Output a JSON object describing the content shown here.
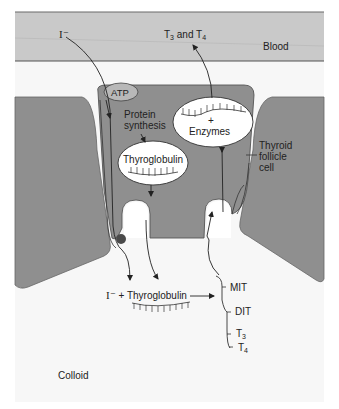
{
  "diagram": {
    "title": "",
    "colors": {
      "page_bg": "#ffffff",
      "colloid_bg": "#f7f7f7",
      "blood_band": "#c9c9c9",
      "cell_fill": "#8f8f8f",
      "cell_outline": "#555555",
      "vesicle_fill": "#ffffff",
      "line": "#222222",
      "atp_fill": "#b8b8b8",
      "transporter_dot": "#4a4a4a"
    },
    "regions": {
      "blood": "Blood",
      "cell": "Thyroid follicle cell",
      "cell_line1": "Thyroid",
      "cell_line2": "follicle",
      "cell_line3": "cell",
      "colloid": "Colloid"
    },
    "labels": {
      "iodide_in": "I⁻",
      "hormones_out_T3": "T",
      "hormones_out_3": "3",
      "hormones_out_and": " and T",
      "hormones_out_4": "4",
      "atp": "ATP",
      "protein_synthesis_1": "Protein",
      "protein_synthesis_2": "synthesis",
      "thyroglobulin": "Thyroglobulin",
      "enzymes_plus": "+",
      "enzymes": "Enzymes",
      "colloid_iodide": "I⁻",
      "colloid_plus_tg": " + Thyroglobulin",
      "mit": "MIT",
      "dit": "DIT",
      "t3_T": "T",
      "t3_sub": "3",
      "t4_T": "T",
      "t4_sub": "4"
    },
    "nodes": [
      {
        "id": "blood",
        "label": "Blood"
      },
      {
        "id": "iodide",
        "label": "I⁻"
      },
      {
        "id": "atp",
        "label": "ATP"
      },
      {
        "id": "protein-synthesis",
        "label": "Protein synthesis"
      },
      {
        "id": "thyroglobulin-vesicle",
        "label": "Thyroglobulin"
      },
      {
        "id": "enzyme-vesicle",
        "label": "+ Enzymes"
      },
      {
        "id": "colloid-thyroglobulin",
        "label": "I⁻ + Thyroglobulin"
      },
      {
        "id": "iodinated-products",
        "label": "MIT, DIT, T3, T4"
      },
      {
        "id": "hormones",
        "label": "T3 and T4"
      },
      {
        "id": "colloid",
        "label": "Colloid"
      }
    ],
    "edges": [
      {
        "from": "iodide",
        "to": "colloid-thyroglobulin",
        "note": "I⁻ transported through cell (ATP) into colloid"
      },
      {
        "from": "protein-synthesis",
        "to": "thyroglobulin-vesicle"
      },
      {
        "from": "thyroglobulin-vesicle",
        "to": "colloid-thyroglobulin",
        "note": "exocytosis"
      },
      {
        "from": "colloid-thyroglobulin",
        "to": "iodinated-products"
      },
      {
        "from": "iodinated-products",
        "to": "enzyme-vesicle",
        "note": "endocytosis"
      },
      {
        "from": "enzyme-vesicle",
        "to": "hormones",
        "note": "release into blood"
      }
    ]
  }
}
